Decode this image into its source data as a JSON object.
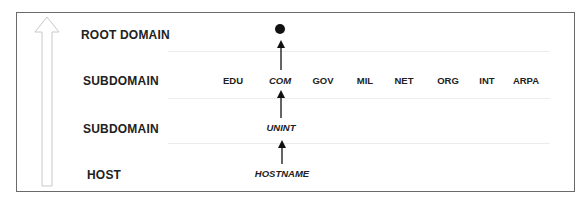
{
  "diagram": {
    "levels": [
      {
        "label": "ROOT DOMAIN"
      },
      {
        "label": "SUBDOMAIN"
      },
      {
        "label": "SUBDOMAIN"
      },
      {
        "label": "HOST"
      }
    ],
    "root": {
      "symbol": "dot"
    },
    "top_level_domains": [
      "EDU",
      "COM",
      "GOV",
      "MIL",
      "NET",
      "ORG",
      "INT",
      "ARPA"
    ],
    "highlighted_tld": "COM",
    "subdomain": "UNINT",
    "host": "HOSTNAME",
    "direction_indicator": "up-arrow"
  }
}
